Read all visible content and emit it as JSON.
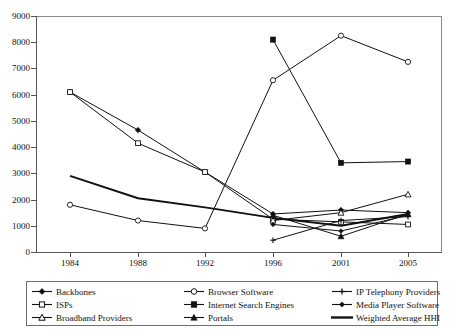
{
  "chart_data": {
    "type": "line",
    "title": "",
    "xlabel": "",
    "ylabel": "",
    "categories": [
      "1984",
      "1988",
      "1992",
      "1996",
      "2001",
      "2005"
    ],
    "ylim": [
      0,
      9000
    ],
    "ytick_step": 1000,
    "yticks": [
      "0",
      "1000",
      "2000",
      "3000",
      "4000",
      "5000",
      "6000",
      "7000",
      "8000",
      "9000"
    ],
    "grid": false,
    "legend_position": "below",
    "series": [
      {
        "name": "Backbones",
        "marker": "filled-diamond",
        "values": [
          6100,
          4650,
          3050,
          1450,
          1600,
          1500
        ]
      },
      {
        "name": "ISPs",
        "marker": "open-square",
        "values": [
          6100,
          4150,
          3050,
          1250,
          1150,
          1050
        ]
      },
      {
        "name": "Broadband Providers",
        "marker": "open-triangle",
        "values": [
          null,
          null,
          null,
          1200,
          1500,
          2200
        ]
      },
      {
        "name": "Browser Software",
        "marker": "open-circle",
        "values": [
          1800,
          1200,
          900,
          6550,
          8250,
          7250
        ]
      },
      {
        "name": "Internet Search Engines",
        "marker": "filled-square",
        "values": [
          null,
          null,
          null,
          8100,
          3400,
          3450
        ]
      },
      {
        "name": "Portals",
        "marker": "filled-triangle",
        "values": [
          null,
          null,
          null,
          1400,
          600,
          1450
        ]
      },
      {
        "name": "IP Telephony Providers",
        "marker": "plus",
        "values": [
          null,
          null,
          null,
          450,
          1200,
          1350
        ]
      },
      {
        "name": "Media Player Software",
        "marker": "filled-diamond-small",
        "values": [
          null,
          null,
          null,
          1050,
          800,
          1400
        ]
      },
      {
        "name": "Weighted Average HHI",
        "marker": "none",
        "values": [
          2900,
          2050,
          1700,
          1300,
          1000,
          1450
        ]
      }
    ],
    "colors": {
      "line": "#111111",
      "axis": "#555555",
      "frame": "#8a8a8a",
      "background": "#ffffff"
    }
  },
  "legend": {
    "entries": [
      {
        "label": "Backbones",
        "marker": "filled-diamond"
      },
      {
        "label": "ISPs",
        "marker": "open-square"
      },
      {
        "label": "Broadband Providers",
        "marker": "open-triangle"
      },
      {
        "label": "Browser Software",
        "marker": "open-circle"
      },
      {
        "label": "Internet Search Engines",
        "marker": "filled-square"
      },
      {
        "label": "Portals",
        "marker": "filled-triangle"
      },
      {
        "label": "IP Telephony Providers",
        "marker": "plus"
      },
      {
        "label": "Media Player Software",
        "marker": "filled-diamond-small"
      },
      {
        "label": "Weighted Average HHI",
        "marker": "none"
      }
    ]
  }
}
